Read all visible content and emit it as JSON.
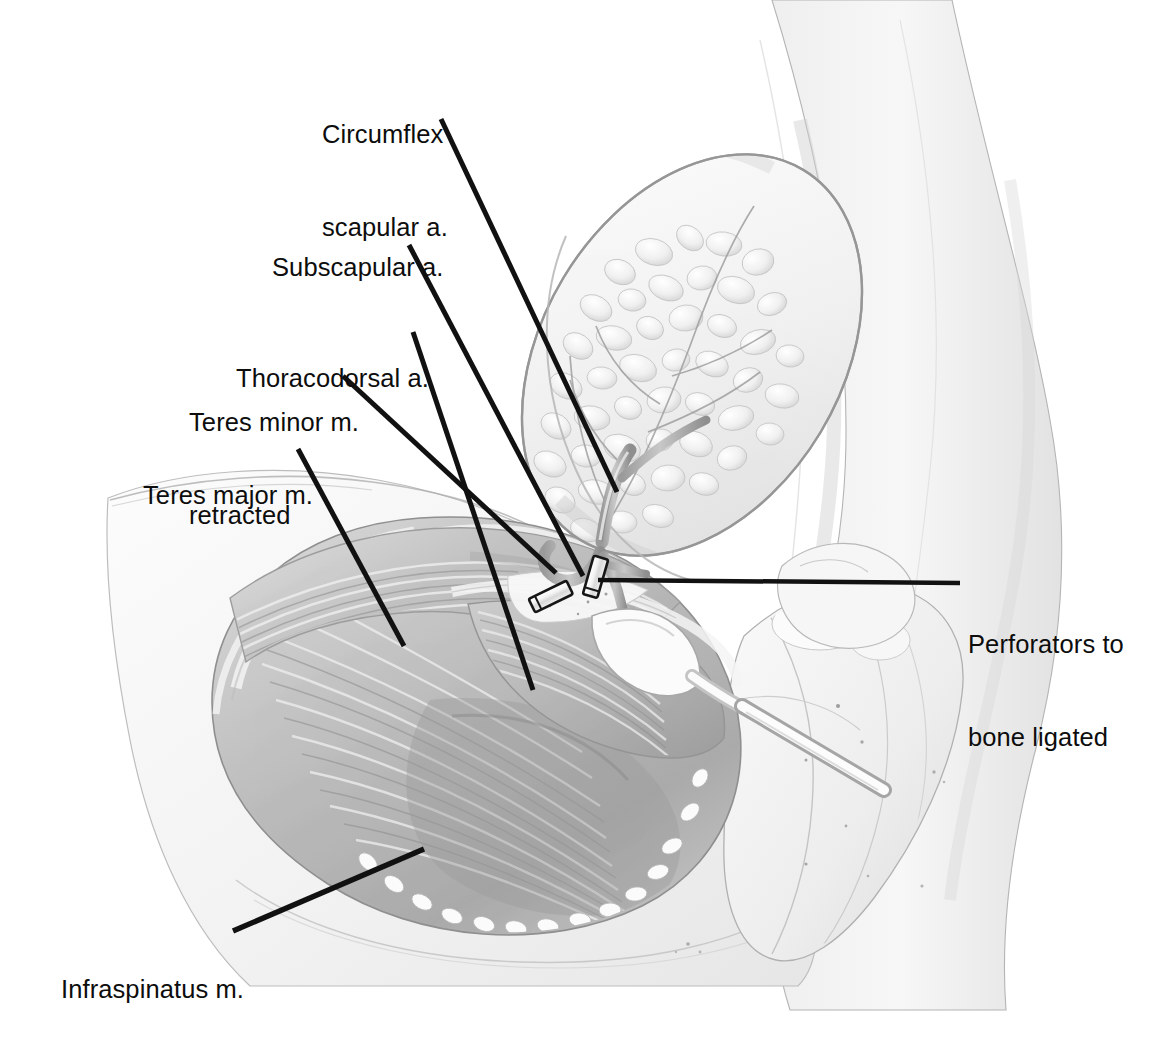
{
  "figure": {
    "kind": "medical-illustration",
    "style": "graphite pencil rendering, grayscale",
    "background_color": "#ffffff",
    "leader_line_color": "#111111",
    "label_text_color": "#0d0d0d"
  },
  "labels": [
    {
      "id": "circumflex-scapular-artery",
      "lines": [
        "Circumflex",
        "scapular a."
      ],
      "text": "Circumflex scapular a.",
      "x": 322,
      "y": 57,
      "align": "left"
    },
    {
      "id": "subscapular-artery",
      "lines": [
        "Subscapular a."
      ],
      "text": "Subscapular a.",
      "x": 272,
      "y": 190,
      "align": "left"
    },
    {
      "id": "thoracodorsal-artery",
      "lines": [
        "Thoracodorsal a."
      ],
      "text": "Thoracodorsal a.",
      "x": 236,
      "y": 301,
      "align": "left"
    },
    {
      "id": "teres-minor-muscle-retracted",
      "lines": [
        "Teres minor m.",
        "retracted"
      ],
      "text": "Teres minor m. retracted",
      "x": 189,
      "y": 345,
      "align": "left"
    },
    {
      "id": "teres-major-muscle",
      "lines": [
        "Teres major m."
      ],
      "text": "Teres major m.",
      "x": 143,
      "y": 418,
      "align": "left"
    },
    {
      "id": "perforators-to-bone-ligated",
      "lines": [
        "Perforators to",
        "bone ligated"
      ],
      "text": "Perforators to bone ligated",
      "x": 968,
      "y": 567,
      "align": "left"
    },
    {
      "id": "infraspinatus-muscle",
      "lines": [
        "Infraspinatus m."
      ],
      "text": "Infraspinatus m.",
      "x": 61,
      "y": 912,
      "align": "left"
    }
  ],
  "leaders": [
    {
      "id": "leader-circumflex-scapular-artery",
      "from": [
        441,
        119
      ],
      "to": [
        617,
        492
      ],
      "width": 5.0
    },
    {
      "id": "leader-subscapular-artery",
      "from": [
        409,
        245
      ],
      "to": [
        583,
        576
      ],
      "width": 5.0
    },
    {
      "id": "leader-thoracodorsal-artery",
      "from": [
        413,
        332
      ],
      "to": [
        533,
        690
      ],
      "width": 5.0
    },
    {
      "id": "leader-teres-minor-retracted",
      "from": [
        343,
        376
      ],
      "to": [
        556,
        573
      ],
      "width": 5.0
    },
    {
      "id": "leader-teres-major",
      "from": [
        298,
        449
      ],
      "to": [
        404,
        646
      ],
      "width": 5.0
    },
    {
      "id": "leader-perforators",
      "from": [
        960,
        583
      ],
      "to": [
        598,
        580
      ],
      "width": 4.5
    },
    {
      "id": "leader-infraspinatus",
      "from": [
        233,
        931
      ],
      "to": [
        424,
        849
      ],
      "width": 5.5
    }
  ],
  "anatomy": {
    "structures": [
      {
        "id": "skin-flap",
        "name": "Elevated scapular skin/fat flap",
        "note": "oval island of subcutaneous fat lobules, raised and reflected superolaterally"
      },
      {
        "id": "infraspinatus-muscle-belly",
        "name": "Infraspinatus m.",
        "note": "large fan of radiating muscle fibers filling the infraspinous fossa"
      },
      {
        "id": "teres-major-muscle-belly",
        "name": "Teres major m.",
        "note": "muscle band along the lateral scapular border"
      },
      {
        "id": "teres-minor-muscle-belly",
        "name": "Teres minor m.",
        "note": "retracted superiorly to expose the triangular space"
      },
      {
        "id": "subscapular-artery-vessel",
        "name": "Subscapular a.",
        "note": "main pedicle trunk"
      },
      {
        "id": "circumflex-scapular-artery-vessel",
        "name": "Circumflex scapular a.",
        "note": "branch through triangular space into the flap"
      },
      {
        "id": "thoracodorsal-artery-vessel",
        "name": "Thoracodorsal a.",
        "note": "descending branch toward latissimus dorsi"
      },
      {
        "id": "scapula-bone",
        "name": "Lateral scapular border / bone",
        "note": "exposed bone with periosteal stippling"
      },
      {
        "id": "retractor-instrument",
        "name": "Retractor",
        "note": "metal instrument crossing diagonally, lifting the scapular border"
      },
      {
        "id": "ligature-clip-1",
        "name": "Ligature clip on perforator",
        "note": "small outlined metal clip, lower left of pedicle"
      },
      {
        "id": "ligature-clip-2",
        "name": "Ligature clip on perforator",
        "note": "small outlined metal clip at the perforator stump"
      },
      {
        "id": "torso-contour",
        "name": "Torso and arm contour",
        "note": "faint pencil outline of body wall and arm surrounding the dissection"
      }
    ]
  }
}
